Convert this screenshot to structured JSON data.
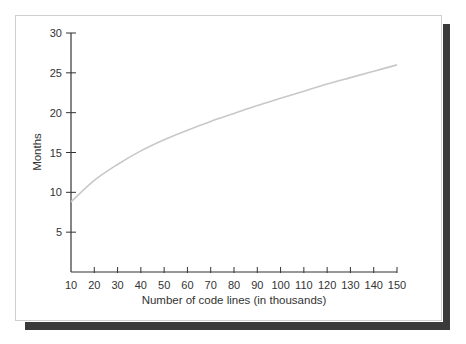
{
  "chart_data": {
    "type": "line",
    "title": "",
    "xlabel": "Number of code lines (in thousands)",
    "ylabel": "Months",
    "x": [
      10,
      20,
      30,
      40,
      50,
      60,
      70,
      80,
      90,
      100,
      110,
      120,
      130,
      140,
      150
    ],
    "series": [
      {
        "name": "Months",
        "values": [
          8.8,
          11.5,
          13.5,
          15.2,
          16.6,
          17.8,
          18.9,
          19.9,
          20.9,
          21.8,
          22.7,
          23.6,
          24.4,
          25.2,
          26.0
        ],
        "color": "#c8c8c8"
      }
    ],
    "xticks": [
      "10",
      "20",
      "30",
      "40",
      "50",
      "60",
      "70",
      "80",
      "90",
      "100",
      "110",
      "120",
      "130",
      "140",
      "150"
    ],
    "yticks": [
      "5",
      "10",
      "15",
      "20",
      "25",
      "30"
    ],
    "xlim": [
      10,
      150
    ],
    "ylim": [
      0,
      30
    ],
    "grid": false,
    "legend": null
  },
  "colors": {
    "axis": "#333333",
    "curve": "#c8c8c8",
    "shadow": "#3a3a3a",
    "frame_border": "#cfcfcf"
  }
}
